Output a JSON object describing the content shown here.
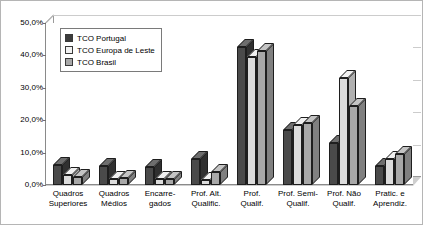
{
  "chart_data": {
    "type": "bar",
    "title": "",
    "subtitle": "",
    "xlabel": "",
    "ylabel": "",
    "ylim": [
      0,
      50
    ],
    "ytick_labels": [
      "0,0%",
      "10,0%",
      "20,0%",
      "30,0%",
      "40,0%",
      "50,0%"
    ],
    "ytick_values": [
      0,
      10,
      20,
      30,
      40,
      50
    ],
    "grid": true,
    "legend_position": "top-left-inside",
    "perspective": "3d",
    "categories": [
      "Quadros Superiores",
      "Quadros Médios",
      "Encarre-gados",
      "Prof. Alt. Qualific.",
      "Prof. Qualif.",
      "Prof. Semi-Qualif.",
      "Prof. Não Qualif.",
      "Pratic. e Aprendiz."
    ],
    "category_lines": [
      [
        "Quadros",
        "Superiores"
      ],
      [
        "Quadros",
        "Médios"
      ],
      [
        "Encarre-",
        "gados"
      ],
      [
        "Prof. Alt.",
        "Qualific."
      ],
      [
        "Prof.",
        "Qualif."
      ],
      [
        "Prof. Semi-",
        "Qualif."
      ],
      [
        "Prof. Não",
        "Qualif."
      ],
      [
        "Pratic. e",
        "Aprendiz."
      ]
    ],
    "series": [
      {
        "name": "TCO Portugal",
        "color": "#4a4a4a",
        "top_color": "#6e6e6e",
        "side_color": "#303030",
        "values": [
          6.2,
          6.0,
          5.6,
          8.0,
          42.5,
          17.0,
          13.0,
          6.0
        ]
      },
      {
        "name": "TCO Europa de Leste",
        "color": "#dcdcdc",
        "top_color": "#f0f0f0",
        "side_color": "#b0b0b0",
        "values": [
          3.0,
          2.0,
          1.8,
          1.5,
          39.5,
          18.5,
          33.0,
          8.0
        ]
      },
      {
        "name": "TCO Brasil",
        "color": "#a8a8a8",
        "top_color": "#c4c4c4",
        "side_color": "#808080",
        "values": [
          2.4,
          2.2,
          2.0,
          4.0,
          41.5,
          19.0,
          24.5,
          9.5
        ]
      }
    ]
  },
  "legend": {
    "items": [
      {
        "label": "TCO Portugal",
        "color": "#3c3c3c"
      },
      {
        "label": "TCO Europa de Leste",
        "color": "#f2f2f2"
      },
      {
        "label": "TCO Brasil",
        "color": "#a8a8a8"
      }
    ]
  }
}
